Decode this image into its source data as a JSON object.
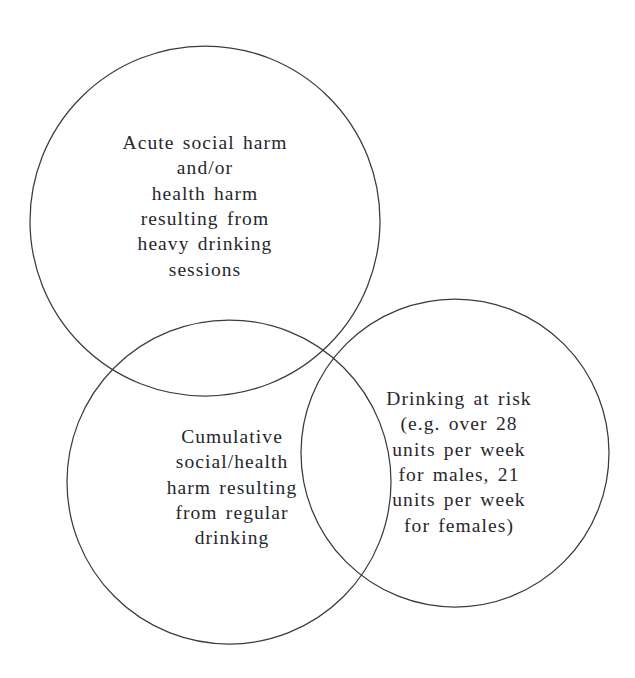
{
  "diagram": {
    "type": "venn-three-circle",
    "title": "",
    "background_color": "#ffffff",
    "stroke_color": "#3a3a44",
    "text_color": "#27272e",
    "circles": [
      {
        "id": "acute-harm",
        "name": "Acute social harm and/or health harm resulting from heavy drinking sessions",
        "text": "Acute social harm\nand/or\nhealth harm\nresulting from\nheavy drinking\nsessions",
        "cx": 205,
        "cy": 221,
        "r": 175
      },
      {
        "id": "cumulative-harm",
        "name": "Cumulative social/health harm resulting from regular drinking",
        "text": "Cumulative\nsocial/health\nharm resulting\nfrom regular\ndrinking",
        "cx": 229,
        "cy": 482,
        "r": 162
      },
      {
        "id": "drinking-at-risk",
        "name": "Drinking at risk (e.g. over 28 units per week for males, 21 units per week for females)",
        "text": "Drinking at risk\n(e.g. over 28\nunits per week\nfor males, 21\nunits per week\nfor females)",
        "cx": 455,
        "cy": 453,
        "r": 154
      }
    ]
  }
}
